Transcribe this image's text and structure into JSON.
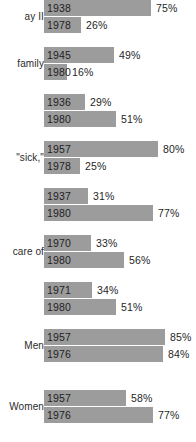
{
  "chart_data": {
    "type": "bar",
    "title": "",
    "xlabel": "",
    "ylabel": "",
    "xlim": [
      0,
      100
    ],
    "grid": false,
    "legend": "none",
    "orientation": "horizontal",
    "value_suffix": "%",
    "groups": [
      {
        "label": "ay II",
        "bars": [
          {
            "year": "1938",
            "value": 75,
            "value_label": "75%"
          },
          {
            "year": "1978",
            "value": 26,
            "value_label": "26%"
          }
        ]
      },
      {
        "label": "family",
        "bars": [
          {
            "year": "1945",
            "value": 49,
            "value_label": "49%"
          },
          {
            "year": "1980",
            "value": 16,
            "value_label": "16%"
          }
        ]
      },
      {
        "label": "",
        "bars": [
          {
            "year": "1936",
            "value": 29,
            "value_label": "29%"
          },
          {
            "year": "1980",
            "value": 51,
            "value_label": "51%"
          }
        ]
      },
      {
        "label": "\"sick,\"",
        "bars": [
          {
            "year": "1957",
            "value": 80,
            "value_label": "80%"
          },
          {
            "year": "1978",
            "value": 25,
            "value_label": "25%"
          }
        ]
      },
      {
        "label": "",
        "bars": [
          {
            "year": "1937",
            "value": 31,
            "value_label": "31%"
          },
          {
            "year": "1980",
            "value": 77,
            "value_label": "77%"
          }
        ]
      },
      {
        "label": "care of",
        "bars": [
          {
            "year": "1970",
            "value": 33,
            "value_label": "33%"
          },
          {
            "year": "1980",
            "value": 56,
            "value_label": "56%"
          }
        ]
      },
      {
        "label": "",
        "bars": [
          {
            "year": "1971",
            "value": 34,
            "value_label": "34%"
          },
          {
            "year": "1980",
            "value": 51,
            "value_label": "51%"
          }
        ]
      },
      {
        "label": "Men",
        "bars": [
          {
            "year": "1957",
            "value": 85,
            "value_label": "85%"
          },
          {
            "year": "1976",
            "value": 84,
            "value_label": "84%"
          }
        ]
      },
      {
        "label": "Women",
        "bars": [
          {
            "year": "1957",
            "value": 58,
            "value_label": "58%"
          },
          {
            "year": "1976",
            "value": 77,
            "value_label": "77%"
          }
        ]
      }
    ]
  },
  "style": {
    "bar_color": "#9c9c9c",
    "text_color": "#1f1f1f",
    "background": "#ffffff"
  },
  "layout": {
    "bar_origin_x": 44,
    "px_per_percent": 1.42,
    "bar_height": 16,
    "bar_gap": 1,
    "group_gap": 14,
    "group_tops": [
      0,
      47,
      94,
      141,
      188,
      235,
      282,
      329,
      390
    ]
  }
}
